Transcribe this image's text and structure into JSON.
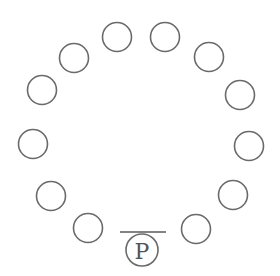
{
  "diagram": {
    "stroke_color": "#6a6a6a",
    "seat_radius": 14.5,
    "seats": [
      {
        "id": 1,
        "cx": 117,
        "cy": 37
      },
      {
        "id": 2,
        "cx": 165,
        "cy": 37
      },
      {
        "id": 3,
        "cx": 209,
        "cy": 57
      },
      {
        "id": 4,
        "cx": 240,
        "cy": 95
      },
      {
        "id": 5,
        "cx": 249,
        "cy": 146
      },
      {
        "id": 6,
        "cx": 233,
        "cy": 195
      },
      {
        "id": 7,
        "cx": 196,
        "cy": 229
      },
      {
        "id": 8,
        "cx": 88,
        "cy": 228
      },
      {
        "id": 9,
        "cx": 51,
        "cy": 196
      },
      {
        "id": 10,
        "cx": 33,
        "cy": 144
      },
      {
        "id": 11,
        "cx": 42,
        "cy": 90
      },
      {
        "id": 12,
        "cx": 74,
        "cy": 58
      }
    ],
    "marked_seat": {
      "label": "P",
      "cx": 142,
      "cy": 250,
      "r": 16
    },
    "table_edge": {
      "x1": 120,
      "y1": 232,
      "x2": 166,
      "y2": 232
    }
  }
}
